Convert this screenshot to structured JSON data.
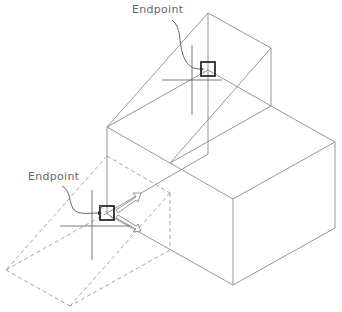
{
  "diagram": {
    "type": "isometric CAD object snap illustration",
    "labels": [
      {
        "id": "top",
        "text": "Endpoint",
        "x": 132,
        "y": 3
      },
      {
        "id": "bottom",
        "text": "Endpoint",
        "x": 28,
        "y": 170
      }
    ],
    "colors": {
      "background": "#ffffff",
      "geometry_line": "#8a8a8a",
      "hidden_line": "#9a9a9a",
      "snap_marker": "#111111",
      "label_text": "#666666"
    },
    "snap_markers": [
      {
        "id": "top",
        "x": 201,
        "y": 62,
        "size": 14
      },
      {
        "id": "bottom",
        "x": 100,
        "y": 206,
        "size": 14
      }
    ]
  }
}
